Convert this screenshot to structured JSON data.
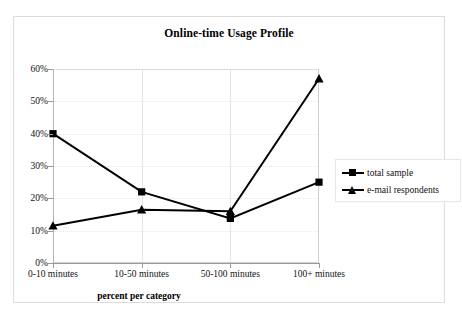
{
  "chart_data": {
    "type": "line",
    "title": "Online-time Usage Profile",
    "xlabel": "percent per category",
    "ylabel": "",
    "categories": [
      "0-10 minutes",
      "10-50 minutes",
      "50-100 minutes",
      "100+ minutes"
    ],
    "series": [
      {
        "name": "total sample",
        "marker": "square",
        "values": [
          40,
          22,
          13.8,
          25
        ]
      },
      {
        "name": "e-mail respondents",
        "marker": "triangle",
        "values": [
          11.5,
          16.5,
          16,
          57
        ]
      }
    ],
    "ylim": [
      0,
      60
    ],
    "ytick_labels": [
      "0%",
      "10%",
      "20%",
      "30%",
      "40%",
      "50%",
      "60%"
    ],
    "ytick_values": [
      0,
      10,
      20,
      30,
      40,
      50,
      60
    ],
    "grid": true,
    "legend_position": "right",
    "line_color": "#000000",
    "grid_color": "#e8e8e8",
    "axis_color": "#9a9a9a"
  },
  "legend": {
    "items": [
      {
        "label": "total sample",
        "marker": "square-marker"
      },
      {
        "label": "e-mail respondents",
        "marker": "triangle-marker"
      }
    ]
  }
}
